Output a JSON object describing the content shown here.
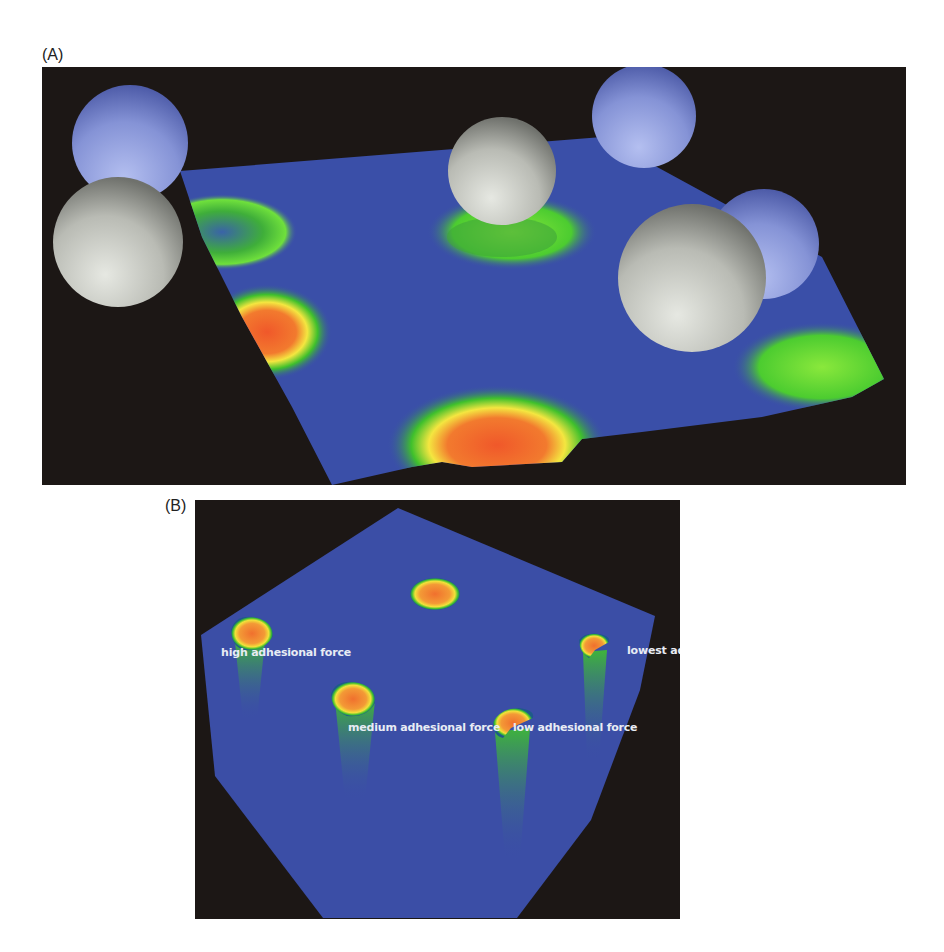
{
  "figure": {
    "panels": [
      {
        "label": "(A)",
        "description": "3D rendering of a deformed surface with adhesion-force heat map and spherical probe particles",
        "colors": {
          "background": "#1c1715",
          "surface": "#3a4fa8",
          "low": "#3fbf2f",
          "mid": "#f2e33a",
          "high": "#f2602a",
          "sphere_grey": "#c9cbc4",
          "sphere_blue": "#8a97d8"
        }
      },
      {
        "label": "(B)",
        "description": "Top-down view of surface with pits of different adhesional force",
        "annotations": [
          {
            "id": "high",
            "text": "high adhesional force"
          },
          {
            "id": "medium",
            "text": "medium adhesional force"
          },
          {
            "id": "low",
            "text": "low adhesional force"
          },
          {
            "id": "lowest",
            "text": "lowest adhesional force"
          }
        ]
      }
    ]
  }
}
